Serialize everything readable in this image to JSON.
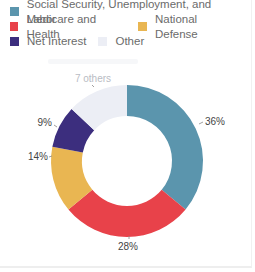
{
  "legend": {
    "items": [
      {
        "label": "Social Security, Unemployment, and Labor",
        "color": "#5b95ad"
      },
      {
        "label": "Medicare and Health",
        "color": "#e8424a"
      },
      {
        "label": "National Defense",
        "color": "#e9b652"
      },
      {
        "label": "Net Interest",
        "color": "#3c2e7e"
      },
      {
        "label": "Other",
        "color": "#eceef5"
      }
    ]
  },
  "chart_data": {
    "type": "pie",
    "subtype": "donut",
    "title": "",
    "categories": [
      "Social Security, Unemployment, and Labor",
      "Medicare and Health",
      "National Defense",
      "Net Interest",
      "Other"
    ],
    "values": [
      36,
      28,
      14,
      9,
      13
    ],
    "data_labels": [
      "36%",
      "28%",
      "14%",
      "9%",
      "7 others"
    ],
    "colors": [
      "#5b95ad",
      "#e8424a",
      "#e9b652",
      "#3c2e7e",
      "#eceef5"
    ],
    "start_angle": "12 o'clock",
    "direction": "clockwise",
    "legend_position": "top"
  }
}
